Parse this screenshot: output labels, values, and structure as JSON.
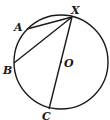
{
  "figure": {
    "type": "circle-geometry",
    "circle": {
      "center": "O",
      "cx": 61,
      "cy": 62,
      "r": 47
    },
    "points": {
      "X": {
        "label": "X",
        "x": 72,
        "y": 17,
        "lx": 71,
        "ly": 14
      },
      "A": {
        "label": "A",
        "x": 27,
        "y": 29,
        "lx": 14,
        "ly": 31
      },
      "B": {
        "label": "B",
        "x": 14,
        "y": 63,
        "lx": 3,
        "ly": 74
      },
      "C": {
        "label": "C",
        "x": 49,
        "y": 109,
        "lx": 42,
        "ly": 120
      },
      "O": {
        "label": "O",
        "x": 61,
        "y": 62,
        "lx": 64,
        "ly": 67
      }
    },
    "segments": [
      {
        "name": "chord-XA",
        "from": "X",
        "to": "A"
      },
      {
        "name": "chord-XB",
        "from": "X",
        "to": "B"
      },
      {
        "name": "diameter-XC",
        "from": "X",
        "to": "C"
      }
    ],
    "stroke_color": "#1a1a1a"
  }
}
